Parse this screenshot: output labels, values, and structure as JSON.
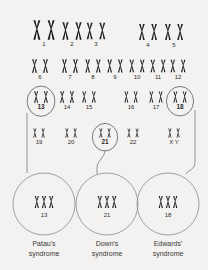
{
  "figure": {
    "background_color": "#f3f2f0",
    "chromosome_color": "#1c1c1c",
    "circle_color": "#5b5b5b"
  },
  "karyotype": {
    "rows": [
      {
        "row_id": "row-1",
        "pairs": [
          {
            "label": "1",
            "x": 44,
            "y": 30,
            "scale": 1.35,
            "circled": false,
            "bold": false
          },
          {
            "label": "2",
            "x": 72,
            "y": 31,
            "scale": 1.2,
            "circled": false,
            "bold": false
          },
          {
            "label": "3",
            "x": 96,
            "y": 31,
            "scale": 1.15,
            "circled": false,
            "bold": false
          },
          {
            "label": "4",
            "x": 148,
            "y": 32,
            "scale": 1.1,
            "circled": false,
            "bold": false
          },
          {
            "label": "5",
            "x": 174,
            "y": 32,
            "scale": 1.1,
            "circled": false,
            "bold": false
          }
        ]
      },
      {
        "row_id": "row-2",
        "pairs": [
          {
            "label": "6",
            "x": 40,
            "y": 66,
            "scale": 0.95,
            "circled": false,
            "bold": false
          },
          {
            "label": "7",
            "x": 70,
            "y": 66,
            "scale": 0.95,
            "circled": false,
            "bold": false
          },
          {
            "label": "8",
            "x": 93,
            "y": 66,
            "scale": 0.9,
            "circled": false,
            "bold": false
          },
          {
            "label": "9",
            "x": 115,
            "y": 66,
            "scale": 0.9,
            "circled": false,
            "bold": false
          },
          {
            "label": "10",
            "x": 137,
            "y": 66,
            "scale": 0.88,
            "circled": false,
            "bold": false
          },
          {
            "label": "11",
            "x": 158,
            "y": 66,
            "scale": 0.88,
            "circled": false,
            "bold": false
          },
          {
            "label": "12",
            "x": 178,
            "y": 66,
            "scale": 0.88,
            "circled": false,
            "bold": false
          }
        ]
      },
      {
        "row_id": "row-3",
        "pairs": [
          {
            "label": "13",
            "x": 41,
            "y": 97,
            "scale": 0.8,
            "circled": true,
            "bold": true
          },
          {
            "label": "14",
            "x": 67,
            "y": 97,
            "scale": 0.8,
            "circled": false,
            "bold": false
          },
          {
            "label": "15",
            "x": 89,
            "y": 97,
            "scale": 0.78,
            "circled": false,
            "bold": false
          },
          {
            "label": "16",
            "x": 131,
            "y": 97,
            "scale": 0.75,
            "circled": false,
            "bold": false
          },
          {
            "label": "17",
            "x": 156,
            "y": 97,
            "scale": 0.75,
            "circled": false,
            "bold": false
          },
          {
            "label": "18",
            "x": 180,
            "y": 97,
            "scale": 0.75,
            "circled": true,
            "bold": true
          }
        ]
      },
      {
        "row_id": "row-4",
        "pairs": [
          {
            "label": "19",
            "x": 39,
            "y": 133,
            "scale": 0.62,
            "circled": false,
            "bold": false
          },
          {
            "label": "20",
            "x": 71,
            "y": 133,
            "scale": 0.62,
            "circled": false,
            "bold": false
          },
          {
            "label": "21",
            "x": 105,
            "y": 133,
            "scale": 0.62,
            "circled": true,
            "bold": true
          },
          {
            "label": "22",
            "x": 133,
            "y": 133,
            "scale": 0.6,
            "circled": false,
            "bold": false
          },
          {
            "label": "X Y",
            "x": 174,
            "y": 133,
            "scale": 0.62,
            "circled": false,
            "bold": false
          }
        ]
      }
    ]
  },
  "trisomies": [
    {
      "id": "trisomy-13",
      "chromosome_label": "13",
      "caption_line1": "Patau's",
      "caption_line2": "syndrome",
      "cx": 44,
      "cy": 204,
      "r": 31,
      "caption_x": 44
    },
    {
      "id": "trisomy-21",
      "chromosome_label": "21",
      "caption_line1": "Down's",
      "caption_line2": "syndrome",
      "cx": 107,
      "cy": 204,
      "r": 31,
      "caption_x": 107
    },
    {
      "id": "trisomy-18",
      "chromosome_label": "18",
      "caption_line1": "Edwards'",
      "caption_line2": "syndrome",
      "cx": 168,
      "cy": 204,
      "r": 31,
      "caption_x": 168
    }
  ]
}
